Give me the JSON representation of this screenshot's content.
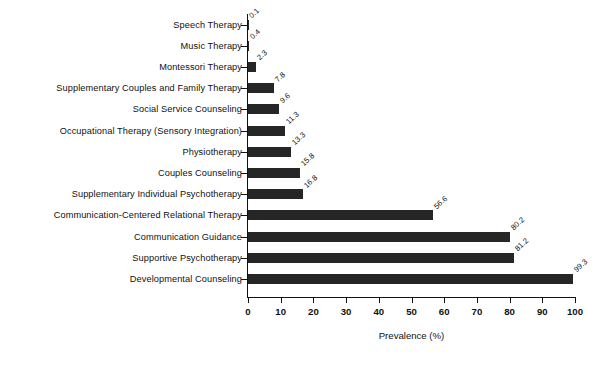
{
  "chart_data": {
    "type": "bar",
    "orientation": "horizontal",
    "title": "",
    "xlabel": "Prevalence (%)",
    "ylabel": "",
    "xlim": [
      0,
      100
    ],
    "xticks": [
      0,
      10,
      20,
      30,
      40,
      50,
      60,
      70,
      80,
      90,
      100
    ],
    "grid": false,
    "legend": null,
    "bar_color": "#262626",
    "categories": [
      "Speech Therapy",
      "Music Therapy",
      "Montessori Therapy",
      "Supplementary Couples and Family Therapy",
      "Social Service Counseling",
      "Occupational Therapy (Sensory Integration)",
      "Physiotherapy",
      "Couples Counseling",
      "Supplementary Individual Psychotherapy",
      "Communication-Centered Relational Therapy",
      "Communication Guidance",
      "Supportive Psychotherapy",
      "Developmental Counseling"
    ],
    "values": [
      0.1,
      0.4,
      2.3,
      7.8,
      9.6,
      11.3,
      13.3,
      15.8,
      16.8,
      56.6,
      80.2,
      81.2,
      99.3
    ],
    "value_labels": [
      "0.1",
      "0.4",
      "2.3",
      "7.8",
      "9.6",
      "11.3",
      "13.3",
      "15.8",
      "16.8",
      "56.6",
      "80.2",
      "81.2",
      "99.3"
    ]
  }
}
